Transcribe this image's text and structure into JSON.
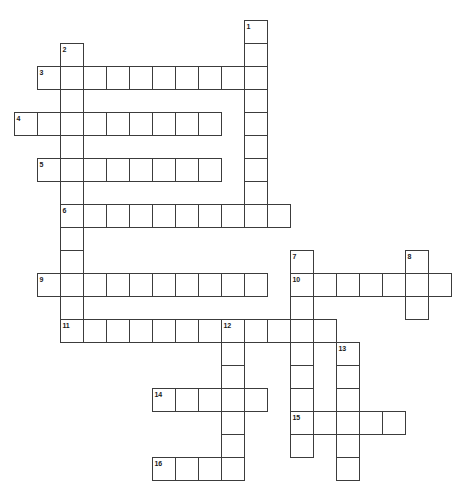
{
  "puzzle": {
    "type": "crossword-grid",
    "title": "Crossword puzzle grid",
    "cell_size": 23,
    "origin_x": 14,
    "origin_y": 20,
    "grid_columns": 20,
    "grid_rows": 20,
    "line_color": "#3c3c3c",
    "cell_color": "#ffffff",
    "background_color": "#ffffff",
    "number_color": "#1a1a1a",
    "entries": [
      {
        "number": "1",
        "direction": "down",
        "col": 10,
        "row": 0,
        "length": 8
      },
      {
        "number": "2",
        "direction": "down",
        "col": 2,
        "row": 1,
        "length": 13
      },
      {
        "number": "3",
        "direction": "across",
        "col": 1,
        "row": 2,
        "length": 10
      },
      {
        "number": "4",
        "direction": "across",
        "col": 0,
        "row": 4,
        "length": 9
      },
      {
        "number": "5",
        "direction": "across",
        "col": 1,
        "row": 6,
        "length": 8
      },
      {
        "number": "6",
        "direction": "across",
        "col": 2,
        "row": 8,
        "length": 10
      },
      {
        "number": "7",
        "direction": "down",
        "col": 12,
        "row": 10,
        "length": 9
      },
      {
        "number": "8",
        "direction": "down",
        "col": 17,
        "row": 10,
        "length": 3
      },
      {
        "number": "9",
        "direction": "across",
        "col": 1,
        "row": 11,
        "length": 10
      },
      {
        "number": "10",
        "direction": "across",
        "col": 12,
        "row": 11,
        "length": 7
      },
      {
        "number": "11",
        "direction": "across",
        "col": 2,
        "row": 13,
        "length": 12
      },
      {
        "number": "12",
        "direction": "down",
        "col": 9,
        "row": 13,
        "length": 7
      },
      {
        "number": "13",
        "direction": "down",
        "col": 14,
        "row": 14,
        "length": 6
      },
      {
        "number": "14",
        "direction": "across",
        "col": 6,
        "row": 16,
        "length": 5
      },
      {
        "number": "15",
        "direction": "across",
        "col": 12,
        "row": 17,
        "length": 5
      },
      {
        "number": "16",
        "direction": "across",
        "col": 6,
        "row": 19,
        "length": 4
      }
    ]
  }
}
